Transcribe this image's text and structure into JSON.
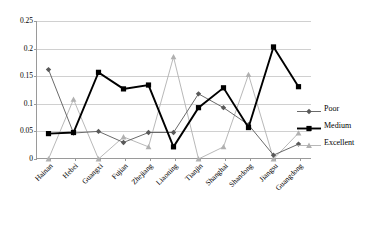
{
  "chart_data": {
    "type": "line",
    "title": "",
    "xlabel": "",
    "ylabel": "",
    "ylim": [
      0,
      0.25
    ],
    "yticks": [
      "0",
      "0.05",
      "0.1",
      "0.15",
      "0.2",
      "0.25"
    ],
    "ytick_values": [
      0,
      0.05,
      0.1,
      0.15,
      0.2,
      0.25
    ],
    "grid": true,
    "legend_position": "right",
    "categories": [
      "Hainan",
      "Hebei",
      "Guangxi",
      "Fujian",
      "Zhejiang",
      "Liaoning",
      "Tianjin",
      "Shanghai",
      "Shandong",
      "Jiangsu",
      "Guangdong"
    ],
    "series": [
      {
        "name": "Poor",
        "color": "#595959",
        "marker": "diamond",
        "values": [
          0.162,
          0.047,
          0.05,
          0.03,
          0.048,
          0.048,
          0.118,
          0.093,
          0.062,
          0.007,
          0.027
        ]
      },
      {
        "name": "Medium",
        "color": "#000000",
        "marker": "square",
        "values": [
          0.046,
          0.048,
          0.157,
          0.127,
          0.134,
          0.022,
          0.093,
          0.129,
          0.057,
          0.203,
          0.131
        ]
      },
      {
        "name": "Excellent",
        "color": "#b0b0b0",
        "marker": "triangle",
        "values": [
          0.0,
          0.108,
          0.0,
          0.04,
          0.022,
          0.185,
          0.0,
          0.022,
          0.153,
          0.0,
          0.047
        ]
      }
    ]
  },
  "legend": {
    "items": [
      {
        "label": "Poor"
      },
      {
        "label": "Medium"
      },
      {
        "label": "Excellent"
      }
    ]
  }
}
